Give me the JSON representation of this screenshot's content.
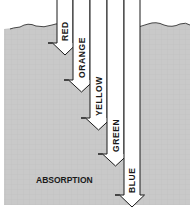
{
  "diagram": {
    "title": "",
    "region_label": "ABSORPTION",
    "colors": {
      "water": "#c9c9c9",
      "water_grid": "#bdbdbd",
      "arrow_fill": "#ffffff",
      "arrow_stroke": "#1a1a1a",
      "background": "#ffffff"
    },
    "arrows": [
      {
        "label": "RED",
        "x_left": 57,
        "x_right": 73,
        "tip_y": 55
      },
      {
        "label": "ORANGE",
        "x_left": 73,
        "x_right": 90,
        "tip_y": 92
      },
      {
        "label": "YELLOW",
        "x_left": 90,
        "x_right": 107,
        "tip_y": 130
      },
      {
        "label": "GREEN",
        "x_left": 107,
        "x_right": 124,
        "tip_y": 166
      },
      {
        "label": "BLUE",
        "x_left": 124,
        "x_right": 140,
        "tip_y": 207
      }
    ]
  }
}
